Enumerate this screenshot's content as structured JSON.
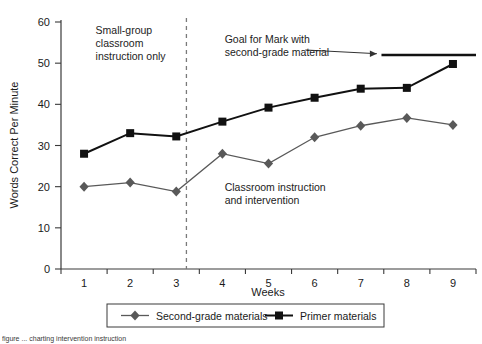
{
  "chart_data": {
    "type": "line",
    "title": "",
    "xlabel": "Weeks",
    "ylabel": "Words Correct Per Minute",
    "x": [
      1,
      2,
      3,
      4,
      5,
      6,
      7,
      8,
      9
    ],
    "xticklabels": [
      "1",
      "2",
      "3",
      "4",
      "5",
      "6",
      "7",
      "8",
      "9"
    ],
    "ylim": [
      0,
      60
    ],
    "yticks": [
      0,
      10,
      20,
      30,
      40,
      50,
      60
    ],
    "yticklabels": [
      "0",
      "10",
      "20",
      "30",
      "40",
      "50",
      "60"
    ],
    "grid": false,
    "legend_position": "bottom",
    "series": [
      {
        "name": "Second-grade materials",
        "marker": "diamond",
        "color": "#595959",
        "x": [
          1,
          2,
          3,
          4,
          5,
          6,
          7,
          8,
          9
        ],
        "values": [
          20,
          21,
          18.8,
          28,
          25.6,
          32,
          34.8,
          36.7,
          35
        ]
      },
      {
        "name": "Primer materials",
        "marker": "square",
        "color": "#111111",
        "x": [
          1,
          2,
          3,
          4,
          5,
          6,
          7,
          8,
          9
        ],
        "values": [
          28,
          33,
          32.2,
          35.8,
          39.2,
          41.6,
          43.8,
          44,
          49.8
        ]
      }
    ],
    "annotations": [
      {
        "name": "phase-label-baseline",
        "text": "Small-group classroom instruction only",
        "lines": [
          "Small-group",
          "classroom",
          "instruction only"
        ],
        "x": 1.25,
        "y": 57
      },
      {
        "name": "goal-annotation",
        "text": "Goal for Mark with second-grade material",
        "lines": [
          "Goal for Mark with",
          "second-grade material"
        ],
        "x": 4.05,
        "y": 55
      },
      {
        "name": "phase-label-intervention",
        "text": "Classroom instruction and intervention",
        "lines": [
          "Classroom instruction",
          "and intervention"
        ],
        "x": 4.05,
        "y": 19
      }
    ],
    "phase_line": {
      "name": "phase-change-line",
      "x": 3.22,
      "style": "dashed"
    },
    "goal_line": {
      "name": "goal-line",
      "y": 52,
      "x_start": 7.45,
      "x_end": 9.6,
      "style": "solid-thick"
    },
    "goal_arrow": {
      "name": "goal-arrow",
      "from_x": 5.8,
      "from_y": 53.2,
      "to_x": 7.35,
      "to_y": 52.3
    }
  },
  "legend": {
    "items": [
      {
        "label": "Second-grade materials",
        "marker": "diamond",
        "color": "#595959"
      },
      {
        "label": "Primer materials",
        "marker": "square",
        "color": "#111111"
      }
    ]
  },
  "caption": {
    "text": "figure ... charting intervention instruction"
  }
}
